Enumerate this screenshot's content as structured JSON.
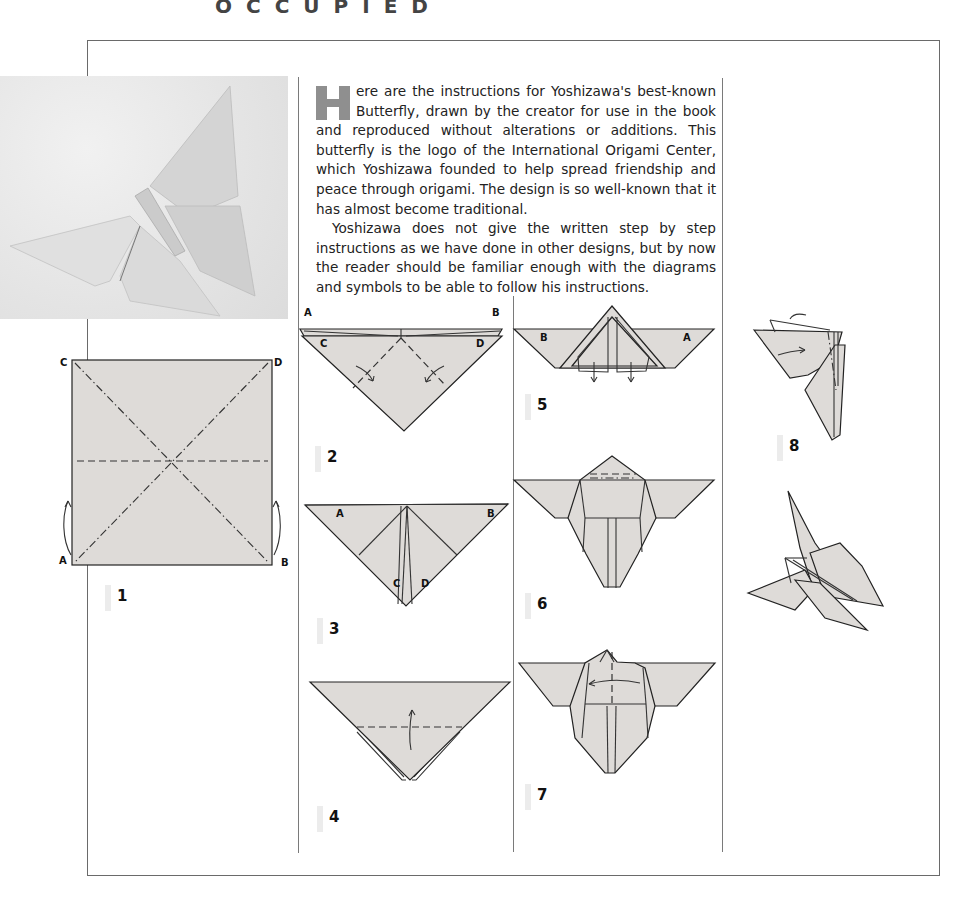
{
  "page": {
    "header_fragment": "OCCUPIED"
  },
  "intro": {
    "dropcap_letter": "H",
    "paragraph1": "ere are the instructions for Yoshizawa's best-known Butterfly, drawn by the creator for use in the book and reproduced without alterations or additions. This butterfly is the logo of the International Origami Center, which Yoshizawa founded to help spread friendship and peace through origami. The design is so well-known that it has almost become traditional.",
    "paragraph2": "Yoshizawa does not give the written step by step instructions as we have done in other designs, but by now the reader should be familiar enough with the diagrams and symbols to be able to follow his instructions."
  },
  "photo": {
    "subject": "folded paper butterfly photograph"
  },
  "colors": {
    "paper_fill": "#dedbd8",
    "line": "#222222",
    "frame": "#6a6a6a",
    "dropcap": "#8f8f8f"
  },
  "steps": [
    {
      "number": "1",
      "corner_labels": [
        "C",
        "D",
        "A",
        "B"
      ]
    },
    {
      "number": "2",
      "corner_labels": [
        "A",
        "B",
        "C",
        "D"
      ]
    },
    {
      "number": "3",
      "corner_labels": [
        "A",
        "B",
        "C",
        "D"
      ]
    },
    {
      "number": "4",
      "corner_labels": []
    },
    {
      "number": "5",
      "corner_labels": [
        "B",
        "A"
      ]
    },
    {
      "number": "6",
      "corner_labels": []
    },
    {
      "number": "7",
      "corner_labels": []
    },
    {
      "number": "8",
      "corner_labels": []
    }
  ],
  "labels": {
    "s1_c": "C",
    "s1_d": "D",
    "s1_a": "A",
    "s1_b": "B",
    "s2_a": "A",
    "s2_b": "B",
    "s2_c": "C",
    "s2_d": "D",
    "s3_a": "A",
    "s3_b": "B",
    "s3_c": "C",
    "s3_d": "D",
    "s5_b": "B",
    "s5_a": "A"
  }
}
